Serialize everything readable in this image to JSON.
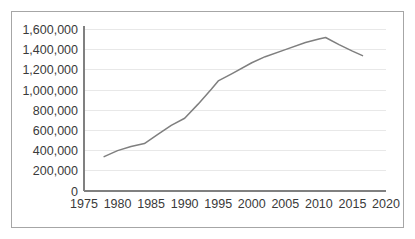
{
  "chart_data": {
    "type": "line",
    "title": "",
    "subtitle": "",
    "xlabel": "",
    "ylabel": "",
    "xlim": [
      1975,
      2020
    ],
    "ylim": [
      0,
      1600000
    ],
    "grid": "horizontal",
    "legend": "none",
    "line_color": "#7f7f7f",
    "border_color": "#a6a6a6",
    "gridline_color": "#e8e8e8",
    "axis_color": "#808080",
    "y_ticks": [
      {
        "value": 1600000,
        "label": "1,600,000"
      },
      {
        "value": 1400000,
        "label": "1,400,000"
      },
      {
        "value": 1200000,
        "label": "1,200,000"
      },
      {
        "value": 1000000,
        "label": "1,000,000"
      },
      {
        "value": 800000,
        "label": "800,000"
      },
      {
        "value": 600000,
        "label": "600,000"
      },
      {
        "value": 400000,
        "label": "400,000"
      },
      {
        "value": 200000,
        "label": "200,000"
      },
      {
        "value": 0,
        "label": "0"
      }
    ],
    "x_ticks": [
      {
        "value": 1975,
        "label": "1975"
      },
      {
        "value": 1980,
        "label": "1980"
      },
      {
        "value": 1985,
        "label": "1985"
      },
      {
        "value": 1990,
        "label": "1990"
      },
      {
        "value": 1995,
        "label": "1995"
      },
      {
        "value": 2000,
        "label": "2000"
      },
      {
        "value": 2005,
        "label": "2005"
      },
      {
        "value": 2010,
        "label": "2010"
      },
      {
        "value": 2015,
        "label": "2015"
      },
      {
        "value": 2020,
        "label": "2020"
      }
    ],
    "x": [
      1978,
      1980,
      1982,
      1984,
      1986,
      1988,
      1990,
      1992,
      1994,
      1995,
      1997,
      2000,
      2002,
      2005,
      2008,
      2010,
      2011,
      2013,
      2015,
      2016.5
    ],
    "values": [
      340000,
      400000,
      440000,
      470000,
      560000,
      650000,
      720000,
      860000,
      1010000,
      1090000,
      1160000,
      1270000,
      1330000,
      1400000,
      1470000,
      1505000,
      1520000,
      1450000,
      1385000,
      1340000
    ],
    "series": [
      {
        "name": "",
        "x": [
          1978,
          1980,
          1982,
          1984,
          1986,
          1988,
          1990,
          1992,
          1994,
          1995,
          1997,
          2000,
          2002,
          2005,
          2008,
          2010,
          2011,
          2013,
          2015,
          2016.5
        ],
        "values": [
          340000,
          400000,
          440000,
          470000,
          560000,
          650000,
          720000,
          860000,
          1010000,
          1090000,
          1160000,
          1270000,
          1330000,
          1400000,
          1470000,
          1505000,
          1520000,
          1450000,
          1385000,
          1340000
        ]
      }
    ]
  }
}
